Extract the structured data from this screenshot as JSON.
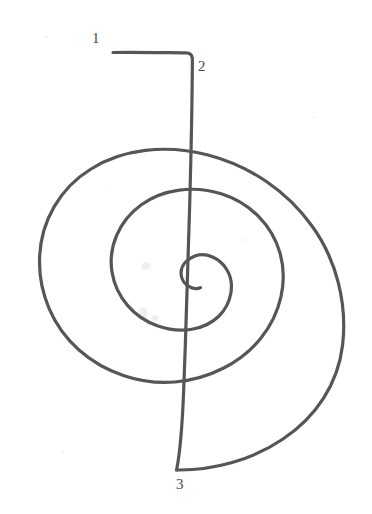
{
  "figure": {
    "kind": "hand-drawn-spiral-diagram",
    "background_color": "#ffffff",
    "stroke_color": "#56565a",
    "stroke_width": 3.2,
    "canvas": {
      "width": 372,
      "height": 514
    },
    "title": ""
  },
  "labels": [
    {
      "id": "label-1",
      "text": "1",
      "x": 92,
      "y": 31,
      "describes": "start of horizontal lead-in line"
    },
    {
      "id": "label-2",
      "text": "2",
      "x": 198,
      "y": 59,
      "describes": "corner where line turns downward"
    },
    {
      "id": "label-3",
      "text": "3",
      "x": 176,
      "y": 477,
      "describes": "bottom end where vertical line meets outer spiral"
    }
  ],
  "geometry": {
    "lead_in_line": {
      "name": "horizontal-lead-in",
      "start": {
        "x": 113,
        "y": 53
      },
      "corner": {
        "x": 192,
        "y": 53
      }
    },
    "vertical_line": {
      "name": "vertical-descender",
      "start": {
        "x": 192,
        "y": 53
      },
      "end": {
        "x": 176,
        "y": 470
      }
    },
    "spiral": {
      "name": "archimedean-spiral",
      "turns": 2.6,
      "center": {
        "x": 178,
        "y": 300
      },
      "outer_extent": {
        "left": 30,
        "right": 343,
        "top": 127,
        "bottom": 470
      },
      "middle_ring": {
        "left": 88,
        "right": 288,
        "top": 192,
        "bottom": 412
      },
      "inner_ring": {
        "left": 135,
        "right": 222,
        "top": 252,
        "bottom": 358
      },
      "terminus": {
        "x": 200,
        "y": 288
      }
    }
  },
  "svg_paths": {
    "lead_in": "M113,52.5 C130,52.2 160,52.6 186,52.8 C190.5,52.9 192.2,54.6 192.4,58.5",
    "descender": "M192.4,58.5 C192.2,96 191.2,150 189.6,208 C188.0,266 186.0,330 183.6,392 C182.0,432 179.4,456 176.6,470",
    "spiral": "M176.6,470 C214,470.5 252,460 283,439 C316,417 338,384 342.6,345 C347.5,303 336,259 312,226 C287,191 250,166 208,155 C166,144 122,149 91,169 C60,188 41,221 39.6,257 C38.2,293 53,327 79,350 C105,373 141,385 175,382 C209,379 241,363 261,338 C281,313 288,281 280,253 C272,225 250,203 222,194 C194,185 163,189 141,205 C119,221 108,247 112,272 C116,297 134,318 158,326 C181,334 205,330 219,316 C232,303 235,283 227,270 C220,258 206,252 195,256 C186,259.5 181,266 181,273 C181,279.5 185,285 191,287.4 C195,289 198.5,288.8 200.4,287.6"
  },
  "artifacts": {
    "smudges": [
      {
        "x": 146,
        "y": 266,
        "w": 10,
        "h": 7,
        "rot": -12
      },
      {
        "x": 143,
        "y": 313,
        "w": 9,
        "h": 11,
        "rot": 5
      },
      {
        "x": 155,
        "y": 318,
        "w": 7,
        "h": 6,
        "rot": 0
      }
    ],
    "flecks": [
      {
        "x": 46,
        "y": 37,
        "r": 1.1
      },
      {
        "x": 243,
        "y": 240,
        "r": 1.0
      },
      {
        "x": 63,
        "y": 452,
        "r": 0.9
      },
      {
        "x": 314,
        "y": 117,
        "r": 0.9
      },
      {
        "x": 110,
        "y": 188,
        "r": 0.8
      }
    ]
  }
}
